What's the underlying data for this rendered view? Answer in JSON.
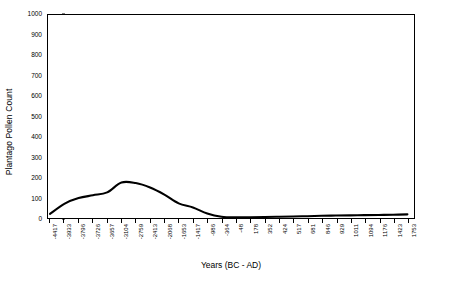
{
  "chart_data": {
    "type": "line",
    "title": "",
    "xlabel": "Years (BC - AD)",
    "ylabel": "Plantago Pollen Count",
    "ylim": [
      0,
      1000
    ],
    "y_ticks": [
      0,
      100,
      200,
      300,
      400,
      500,
      600,
      700,
      800,
      900,
      1000
    ],
    "grid": false,
    "legend": "none",
    "x_tick_labels": [
      "-4417",
      "-3933",
      "-3796",
      "-3726",
      "-3657",
      "-3104",
      "-2759",
      "-2413",
      "-2068",
      "-1653",
      "-1417",
      "-986",
      "-364",
      "-48",
      "178",
      "352",
      "424",
      "517",
      "681",
      "846",
      "929",
      "1011",
      "1094",
      "1176",
      "1423",
      "1753"
    ],
    "categories": [
      "-4417",
      "-3933",
      "-3796",
      "-3726",
      "-3657",
      "-3104",
      "-2759",
      "-2413",
      "-2068",
      "-1653",
      "-1417",
      "-986",
      "-364",
      "-48",
      "178",
      "352",
      "424",
      "517",
      "681",
      "846",
      "929",
      "1011",
      "1094",
      "1176",
      "1423",
      "1753"
    ],
    "series": [
      {
        "name": "Plantago Pollen Count",
        "values": [
          20,
          70,
          98,
          112,
          126,
          175,
          172,
          150,
          115,
          72,
          52,
          22,
          6,
          3,
          4,
          5,
          6,
          7,
          9,
          11,
          12,
          13,
          14,
          15,
          16,
          18
        ]
      }
    ]
  }
}
